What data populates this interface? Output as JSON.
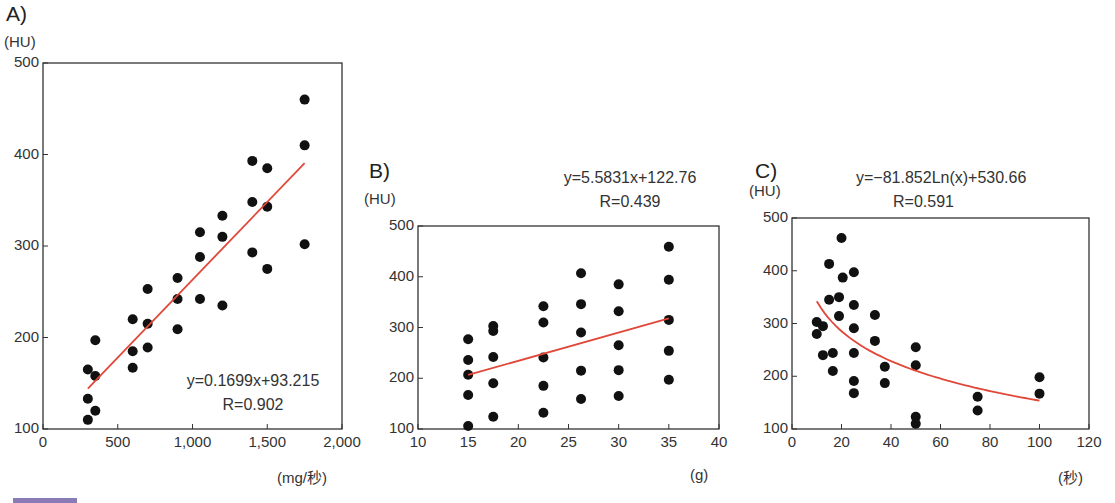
{
  "chart_data": [
    {
      "id": "A",
      "type": "scatter",
      "title": "A)",
      "ylabel": "(HU)",
      "xlabel": "(mg/秒)",
      "xlim": [
        0,
        2000
      ],
      "ylim": [
        100,
        500
      ],
      "xticks": [
        "0",
        "500",
        "1,000",
        "1,500",
        "2,000"
      ],
      "xtick_values": [
        0,
        500,
        1000,
        1500,
        2000
      ],
      "yticks": [
        "100",
        "200",
        "300",
        "400",
        "500"
      ],
      "ytick_values": [
        100,
        200,
        300,
        400,
        500
      ],
      "grid": false,
      "equation": "y=0.1699x+93.215",
      "r_label": "R=0.902",
      "fit": {
        "kind": "linear",
        "slope": 0.1699,
        "intercept": 93.215,
        "x_range": [
          300,
          1750
        ]
      },
      "points": [
        [
          300,
          110
        ],
        [
          300,
          133
        ],
        [
          300,
          165
        ],
        [
          350,
          120
        ],
        [
          350,
          158
        ],
        [
          350,
          197
        ],
        [
          600,
          167
        ],
        [
          600,
          185
        ],
        [
          600,
          220
        ],
        [
          700,
          189
        ],
        [
          700,
          215
        ],
        [
          700,
          253
        ],
        [
          900,
          209
        ],
        [
          900,
          242
        ],
        [
          900,
          265
        ],
        [
          1050,
          242
        ],
        [
          1050,
          288
        ],
        [
          1050,
          315
        ],
        [
          1200,
          235
        ],
        [
          1200,
          310
        ],
        [
          1200,
          333
        ],
        [
          1400,
          293
        ],
        [
          1400,
          348
        ],
        [
          1400,
          393
        ],
        [
          1500,
          275
        ],
        [
          1500,
          343
        ],
        [
          1500,
          385
        ],
        [
          1750,
          302
        ],
        [
          1750,
          410
        ],
        [
          1750,
          460
        ]
      ]
    },
    {
      "id": "B",
      "type": "scatter",
      "title": "B)",
      "ylabel": "(HU)",
      "xlabel": "(g)",
      "xlim": [
        10,
        40
      ],
      "ylim": [
        100,
        500
      ],
      "xticks": [
        "10",
        "15",
        "20",
        "25",
        "30",
        "35",
        "40"
      ],
      "xtick_values": [
        10,
        15,
        20,
        25,
        30,
        35,
        40
      ],
      "yticks": [
        "100",
        "200",
        "300",
        "400",
        "500"
      ],
      "ytick_values": [
        100,
        200,
        300,
        400,
        500
      ],
      "grid": false,
      "equation": "y=5.5831x+122.76",
      "r_label": "R=0.439",
      "fit": {
        "kind": "linear",
        "slope": 5.5831,
        "intercept": 122.76,
        "x_range": [
          15,
          35
        ]
      },
      "points": [
        [
          15,
          277
        ],
        [
          15,
          236
        ],
        [
          15,
          207
        ],
        [
          15,
          167
        ],
        [
          15,
          106
        ],
        [
          17.5,
          303
        ],
        [
          17.5,
          293
        ],
        [
          17.5,
          242
        ],
        [
          17.5,
          190
        ],
        [
          17.5,
          124
        ],
        [
          22.5,
          342
        ],
        [
          22.5,
          310
        ],
        [
          22.5,
          241
        ],
        [
          22.5,
          185
        ],
        [
          22.5,
          132
        ],
        [
          26.25,
          407
        ],
        [
          26.25,
          346
        ],
        [
          26.25,
          290
        ],
        [
          26.25,
          215
        ],
        [
          26.25,
          159
        ],
        [
          30,
          385
        ],
        [
          30,
          332
        ],
        [
          30,
          265
        ],
        [
          30,
          216
        ],
        [
          30,
          165
        ],
        [
          35,
          459
        ],
        [
          35,
          394
        ],
        [
          35,
          315
        ],
        [
          35,
          254
        ],
        [
          35,
          197
        ]
      ]
    },
    {
      "id": "C",
      "type": "scatter",
      "title": "C)",
      "ylabel": "(HU)",
      "xlabel": "(秒)",
      "xlim": [
        0,
        120
      ],
      "ylim": [
        100,
        500
      ],
      "xticks": [
        "0",
        "20",
        "40",
        "60",
        "80",
        "100",
        "120"
      ],
      "xtick_values": [
        0,
        20,
        40,
        60,
        80,
        100,
        120
      ],
      "yticks": [
        "100",
        "200",
        "300",
        "400",
        "500"
      ],
      "ytick_values": [
        100,
        200,
        300,
        400,
        500
      ],
      "grid": false,
      "equation": "y=−81.852Ln(x)+530.66",
      "r_label": "R=0.591",
      "fit": {
        "kind": "log",
        "a": -81.852,
        "b": 530.66,
        "x_range": [
          10,
          100
        ]
      },
      "points": [
        [
          10,
          303
        ],
        [
          10,
          280
        ],
        [
          12.5,
          295
        ],
        [
          12.5,
          240
        ],
        [
          15,
          413
        ],
        [
          15,
          345
        ],
        [
          16.5,
          244
        ],
        [
          16.5,
          210
        ],
        [
          19,
          350
        ],
        [
          19,
          314
        ],
        [
          20,
          462
        ],
        [
          20.5,
          387
        ],
        [
          25,
          397
        ],
        [
          25,
          335
        ],
        [
          25,
          291
        ],
        [
          25,
          244
        ],
        [
          25,
          191
        ],
        [
          25,
          168
        ],
        [
          33.5,
          316
        ],
        [
          33.5,
          267
        ],
        [
          37.5,
          218
        ],
        [
          37.5,
          187
        ],
        [
          50,
          255
        ],
        [
          50,
          221
        ],
        [
          50,
          123
        ],
        [
          50,
          110
        ],
        [
          75,
          161
        ],
        [
          75,
          135
        ],
        [
          100,
          198
        ],
        [
          100,
          167
        ]
      ]
    }
  ],
  "colors": {
    "fit_line": "#e0483a",
    "points": "#111111",
    "axis": "#333333",
    "footer_marker": "#8a7ab5"
  }
}
